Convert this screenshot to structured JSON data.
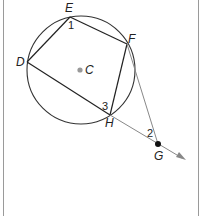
{
  "diagram": {
    "type": "geometry",
    "circle": {
      "center_label": "C",
      "cx": 81,
      "cy": 70,
      "r": 54
    },
    "points": {
      "E": {
        "label": "E",
        "x": 70,
        "y": 17
      },
      "F": {
        "label": "F",
        "x": 127,
        "y": 44
      },
      "D": {
        "label": "D",
        "x": 27,
        "y": 62
      },
      "H": {
        "label": "H",
        "x": 110,
        "y": 115
      },
      "C": {
        "label": "C",
        "x": 80,
        "y": 70
      },
      "G": {
        "label": "G",
        "x": 158,
        "y": 144
      }
    },
    "angles": [
      {
        "label": "1",
        "at": "E"
      },
      {
        "label": "2",
        "at": "G"
      },
      {
        "label": "3",
        "at": "H"
      }
    ],
    "segments": [
      "DE",
      "EF",
      "FH",
      "DH",
      "FG"
    ],
    "rays": [
      "D through H and G"
    ],
    "colors": {
      "line": "#222222",
      "thin_line": "#888888",
      "center_dot": "#999999",
      "point_g": "#111111"
    }
  }
}
